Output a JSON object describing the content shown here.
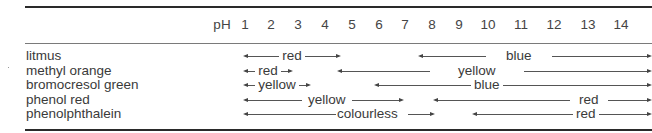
{
  "table": {
    "header": {
      "ph_label": "pH",
      "columns": [
        "1",
        "2",
        "3",
        "4",
        "5",
        "6",
        "7",
        "8",
        "9",
        "10",
        "11",
        "12",
        "13",
        "14"
      ]
    },
    "indicators": [
      {
        "name": "litmus",
        "ranges": [
          {
            "label": "red",
            "from_ph": 1,
            "to_ph": 5
          },
          {
            "label": "blue",
            "from_ph": 8,
            "to_ph": 14
          }
        ]
      },
      {
        "name": "methyl orange",
        "ranges": [
          {
            "label": "red",
            "from_ph": 1,
            "to_ph": 3.2
          },
          {
            "label": "yellow",
            "from_ph": 4.4,
            "to_ph": 14
          }
        ]
      },
      {
        "name": "bromocresol green",
        "ranges": [
          {
            "label": "yellow",
            "from_ph": 1,
            "to_ph": 3.8
          },
          {
            "label": "blue",
            "from_ph": 5.4,
            "to_ph": 14
          }
        ]
      },
      {
        "name": "phenol red",
        "ranges": [
          {
            "label": "yellow",
            "from_ph": 1,
            "to_ph": 6.8
          },
          {
            "label": "red",
            "from_ph": 8.4,
            "to_ph": 14
          }
        ]
      },
      {
        "name": "phenolphthalein",
        "ranges": [
          {
            "label": "colourless",
            "from_ph": 1,
            "to_ph": 8.3
          },
          {
            "label": "red",
            "from_ph": 10,
            "to_ph": 14
          }
        ]
      }
    ]
  }
}
